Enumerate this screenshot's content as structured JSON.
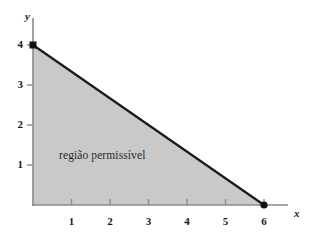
{
  "figure": {
    "background_color": "#ffffff",
    "width": 317,
    "height": 241
  },
  "axes": {
    "x_name": "x",
    "y_name": "y",
    "axis_color": "#8a8a8a"
  },
  "annotation": {
    "region_label": "região permissível"
  },
  "chart_data": {
    "type": "area",
    "title": "",
    "subtitle": "",
    "xlabel": "x",
    "ylabel": "y",
    "xlim": [
      0,
      6.8
    ],
    "ylim": [
      0,
      4.6
    ],
    "xticks": [
      1,
      2,
      3,
      4,
      5,
      6
    ],
    "xtick_labels": [
      "1",
      "2",
      "3",
      "4",
      "5",
      "6"
    ],
    "yticks": [
      1,
      2,
      3,
      4
    ],
    "ytick_labels": [
      "1",
      "2",
      "3",
      "4"
    ],
    "grid": false,
    "legend": null,
    "annotations": [
      {
        "text": "região permissível",
        "x": 0.7,
        "y": 1.0
      }
    ],
    "series": [
      {
        "name": "região permissível",
        "type": "polygon",
        "fill_color": "#c9c9c9",
        "edge_color": "#1a1a1a",
        "points": [
          {
            "x": 0,
            "y": 4
          },
          {
            "x": 6,
            "y": 0
          },
          {
            "x": 0,
            "y": 0
          }
        ]
      },
      {
        "name": "constraint-boundary",
        "type": "line",
        "edge_color": "#1a1a1a",
        "points": [
          {
            "x": 0,
            "y": 4
          },
          {
            "x": 6,
            "y": 0
          }
        ]
      }
    ],
    "markers": [
      {
        "x": 0,
        "y": 4,
        "label": "(0, 4)",
        "color": "#111111"
      },
      {
        "x": 6,
        "y": 0,
        "label": "(6, 0)",
        "color": "#111111"
      }
    ]
  }
}
